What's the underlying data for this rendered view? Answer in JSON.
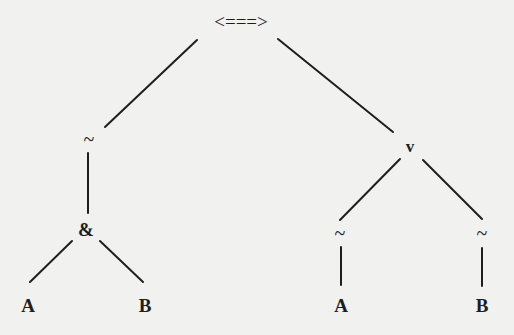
{
  "diagram": {
    "type": "parse-tree",
    "nodes": {
      "root": {
        "label": "<===>",
        "x": 241,
        "y": 28
      },
      "not_left": {
        "label": "~",
        "x": 89,
        "y": 143
      },
      "or": {
        "label": "v",
        "x": 410,
        "y": 152
      },
      "and": {
        "label": "&",
        "x": 86,
        "y": 235
      },
      "and_a": {
        "label": "A",
        "x": 28,
        "y": 311
      },
      "and_b": {
        "label": "B",
        "x": 145,
        "y": 311
      },
      "not_a": {
        "label": "~",
        "x": 340,
        "y": 238
      },
      "not_b": {
        "label": "~",
        "x": 482,
        "y": 238
      },
      "or_a": {
        "label": "A",
        "x": 341,
        "y": 311
      },
      "or_b": {
        "label": "B",
        "x": 482,
        "y": 311
      }
    },
    "edges": [
      {
        "from": "root",
        "to": "not_left"
      },
      {
        "from": "root",
        "to": "or"
      },
      {
        "from": "not_left",
        "to": "and"
      },
      {
        "from": "and",
        "to": "and_a"
      },
      {
        "from": "and",
        "to": "and_b"
      },
      {
        "from": "or",
        "to": "not_a"
      },
      {
        "from": "or",
        "to": "not_b"
      },
      {
        "from": "not_a",
        "to": "or_a"
      },
      {
        "from": "not_b",
        "to": "or_b"
      }
    ]
  }
}
